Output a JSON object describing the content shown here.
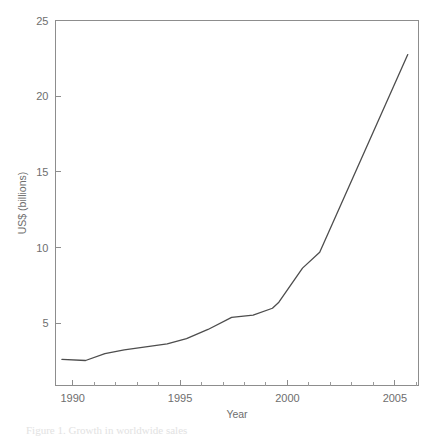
{
  "figure": {
    "background_color": "#ffffff",
    "line_color": "#4d4d4d",
    "axis_color": "#8d8d8d",
    "text_color": "#6e6e6e",
    "caption_partial": "Figure 1.  Growth in worldwide sales"
  },
  "chart_data": {
    "type": "line",
    "title": "",
    "subtitle": "",
    "xlabel": "Year",
    "ylabel": "US$ (billions)",
    "xlim": [
      1989.2,
      1989.2
    ],
    "xlim_values": [
      1989.2,
      2006.1
    ],
    "ylim": [
      0.9,
      25
    ],
    "grid": false,
    "legend": "none",
    "x_major_ticks": [
      1990,
      1995,
      2000,
      2005
    ],
    "x_major_tick_labels": [
      "1990",
      "1995",
      "2000",
      "2005"
    ],
    "x_minor_ticks": [
      1991,
      1992,
      1993,
      1994,
      1996,
      1997,
      1998,
      1999,
      2001,
      2002,
      2003,
      2004,
      2006
    ],
    "y_major_ticks": [
      5,
      10,
      15,
      20,
      25
    ],
    "y_major_tick_labels": [
      "5",
      "10",
      "15",
      "20",
      "25"
    ],
    "series": [
      {
        "name": "Worldwide sales",
        "units": "US$ billions",
        "x": [
          1989.5,
          1990.6,
          1991.5,
          1992.4,
          1993.4,
          1994.4,
          1995.3,
          1996.3,
          1997.4,
          1998.4,
          1999.3,
          1999.6,
          2000.7,
          2001.5,
          2005.6
        ],
        "values": [
          2.62,
          2.55,
          3.0,
          3.25,
          3.45,
          3.65,
          4.0,
          4.6,
          5.4,
          5.55,
          6.0,
          6.4,
          8.65,
          9.7,
          22.75
        ]
      }
    ]
  }
}
